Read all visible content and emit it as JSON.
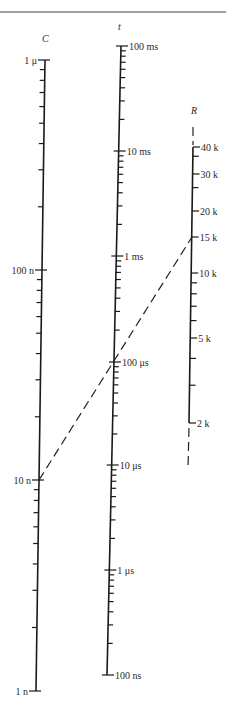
{
  "figure": {
    "type": "nomogram",
    "axes": [
      {
        "id": "C",
        "title": "C",
        "title_pos": [
          42,
          42
        ],
        "top": [
          45,
          60
        ],
        "bottom": [
          36,
          691
        ],
        "scale": "log",
        "major_labels": [
          {
            "label": "1 μ",
            "y": 60,
            "value": 1e-06
          },
          {
            "label": "100 n",
            "y": 270,
            "value": 1e-07
          },
          {
            "label": "10 n",
            "y": 480,
            "value": 1e-08
          },
          {
            "label": "1 n",
            "y": 691,
            "value": 1e-09
          }
        ],
        "label_side": "left"
      },
      {
        "id": "t",
        "title": "t",
        "title_pos": [
          118,
          30
        ],
        "top": [
          121,
          46
        ],
        "bottom": [
          107,
          675
        ],
        "scale": "log",
        "major_labels": [
          {
            "label": "100 ms",
            "y": 46,
            "value": 0.1
          },
          {
            "label": "10 ms",
            "y": 151,
            "value": 0.01
          },
          {
            "label": "1 ms",
            "y": 256,
            "value": 0.001
          },
          {
            "label": "100 μs",
            "y": 362,
            "value": 0.0001
          },
          {
            "label": "10 μs",
            "y": 465,
            "value": 1e-05
          },
          {
            "label": "1 μs",
            "y": 570,
            "value": 1e-06
          },
          {
            "label": "100 ns",
            "y": 675,
            "value": 1e-07
          }
        ],
        "label_side": "right"
      },
      {
        "id": "R",
        "title": "R",
        "title_pos": [
          191,
          114
        ],
        "top": [
          193,
          147
        ],
        "bottom": [
          189,
          423
        ],
        "scale": "log",
        "major_labels": [
          {
            "label": "40 k",
            "y": 147,
            "value": 40000
          },
          {
            "label": "30 k",
            "y": 174,
            "value": 30000
          },
          {
            "label": "20 k",
            "y": 211,
            "value": 20000
          },
          {
            "label": "15 k",
            "y": 237,
            "value": 15000
          },
          {
            "label": "10 k",
            "y": 273,
            "value": 10000
          },
          {
            "label": "5 k",
            "y": 338,
            "value": 5000
          },
          {
            "label": "2 k",
            "y": 423,
            "value": 2000
          }
        ],
        "minor_values": [
          35000,
          25000,
          9000,
          8000,
          7000,
          6000,
          4000,
          3000
        ],
        "dashed_extension_top": [
          [
            193,
            127
          ],
          [
            193,
            145
          ]
        ],
        "dashed_extension_bottom": [
          [
            189,
            428
          ],
          [
            188,
            468
          ]
        ],
        "label_side": "right"
      }
    ],
    "example_line": {
      "style": "dashed",
      "from": {
        "axis": "C",
        "label": "10 n",
        "point": [
          39,
          480
        ]
      },
      "through": {
        "axis": "t",
        "label": "150 μs (approx)",
        "point": [
          114,
          362
        ]
      },
      "to": {
        "axis": "R",
        "label": "15 k",
        "point": [
          192,
          237
        ]
      }
    },
    "top_rule_y": 12
  }
}
